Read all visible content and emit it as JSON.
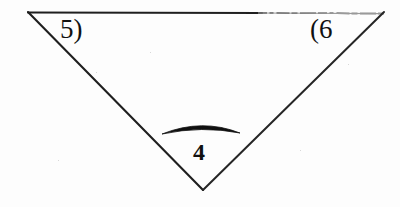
{
  "figure": {
    "type": "geometry-diagram",
    "background_color": "#fdfdfd",
    "ink_color": "#1a1a1a",
    "labels": {
      "left_vertex": "5)",
      "right_vertex": "(6",
      "bottom_angle": "4"
    },
    "shape": {
      "name": "inverted-triangle",
      "vertices": [
        {
          "name": "top-left",
          "x": 28,
          "y": 12
        },
        {
          "name": "top-right",
          "x": 384,
          "y": 12
        },
        {
          "name": "bottom",
          "x": 203,
          "y": 190
        }
      ],
      "stroke_width": 2
    },
    "arc": {
      "name": "angle-arc",
      "start_x": 162,
      "end_x": 240,
      "peak_y": 122,
      "base_y": 134,
      "max_thickness": 7
    }
  }
}
